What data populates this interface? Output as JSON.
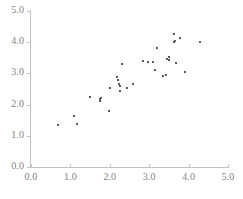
{
  "chart_data": {
    "type": "scatter",
    "title": "",
    "subtitle": "",
    "xlabel": "",
    "ylabel": "",
    "xlim": [
      0.0,
      5.0
    ],
    "ylim": [
      0.0,
      5.0
    ],
    "xticks": [
      "0.0",
      "1.0",
      "2.0",
      "3.0",
      "4.0",
      "5.0"
    ],
    "yticks": [
      "0.0",
      "1.0",
      "2.0",
      "3.0",
      "4.0",
      "5.0"
    ],
    "xtick_values": [
      0.0,
      1.0,
      2.0,
      3.0,
      4.0,
      5.0
    ],
    "ytick_values": [
      0.0,
      1.0,
      2.0,
      3.0,
      4.0,
      5.0
    ],
    "grid": false,
    "legend": null,
    "marker": "square",
    "marker_color": "#5a5a5a",
    "marker_size_px": 2,
    "axis_color": "#c3c3c3",
    "label_color": "#808080",
    "background": "#ffffff",
    "annotations": [],
    "n_points": 41,
    "points": [
      {
        "x": 0.69,
        "y": 1.35
      },
      {
        "x": 1.1,
        "y": 1.63
      },
      {
        "x": 1.17,
        "y": 1.38
      },
      {
        "x": 1.51,
        "y": 2.25
      },
      {
        "x": 1.74,
        "y": 2.17
      },
      {
        "x": 1.76,
        "y": 2.12
      },
      {
        "x": 1.78,
        "y": 2.21
      },
      {
        "x": 1.99,
        "y": 1.81
      },
      {
        "x": 2.01,
        "y": 2.54
      },
      {
        "x": 2.18,
        "y": 2.89
      },
      {
        "x": 2.2,
        "y": 2.78
      },
      {
        "x": 2.24,
        "y": 2.66
      },
      {
        "x": 2.26,
        "y": 2.61
      },
      {
        "x": 2.27,
        "y": 2.42
      },
      {
        "x": 2.32,
        "y": 3.31
      },
      {
        "x": 2.43,
        "y": 2.54
      },
      {
        "x": 2.59,
        "y": 2.66
      },
      {
        "x": 2.84,
        "y": 3.41
      },
      {
        "x": 2.97,
        "y": 3.35
      },
      {
        "x": 3.09,
        "y": 3.35
      },
      {
        "x": 3.15,
        "y": 3.11
      },
      {
        "x": 3.21,
        "y": 3.8
      },
      {
        "x": 3.36,
        "y": 2.92
      },
      {
        "x": 3.43,
        "y": 2.94
      },
      {
        "x": 3.46,
        "y": 3.47
      },
      {
        "x": 3.49,
        "y": 3.52
      },
      {
        "x": 3.51,
        "y": 3.43
      },
      {
        "x": 3.63,
        "y": 4.01
      },
      {
        "x": 3.64,
        "y": 4.26
      },
      {
        "x": 3.66,
        "y": 4.04
      },
      {
        "x": 3.69,
        "y": 3.34
      },
      {
        "x": 3.79,
        "y": 4.14
      },
      {
        "x": 3.92,
        "y": 3.06
      },
      {
        "x": 4.28,
        "y": 4.0
      }
    ]
  },
  "axis": {
    "y_tick_labels": [
      "5.0",
      "4.0",
      "3.0",
      "2.0",
      "1.0",
      "0.0"
    ],
    "x_tick_labels": [
      "0.0",
      "1.0",
      "2.0",
      "3.0",
      "4.0",
      "5.0"
    ]
  }
}
